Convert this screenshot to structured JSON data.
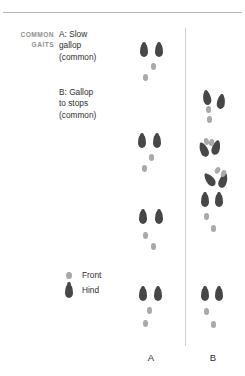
{
  "figure": {
    "section_label_line1": "COMMON",
    "section_label_line2": "GAITS",
    "captions": [
      {
        "id": "caption-a",
        "lines": [
          "A: Slow",
          "gallop",
          "(common)"
        ]
      },
      {
        "id": "caption-b",
        "lines": [
          "B: Gallop",
          "to stops",
          "(common)"
        ]
      }
    ],
    "legend": {
      "front_label": "Front",
      "hind_label": "Hind"
    },
    "columns": [
      {
        "id": "column-a",
        "label": "A"
      },
      {
        "id": "column-b",
        "label": "B"
      }
    ],
    "colors": {
      "hind_print": "#474747",
      "front_print": "#a9a9a9",
      "text": "#2e2e2e",
      "section_label": "#8f8f8f",
      "rule": "#b9b9b9",
      "divider": "#cfcfcf",
      "background": "#ffffff"
    }
  },
  "chart_data": {
    "type": "scatter",
    "xlabel": "",
    "ylabel": "",
    "legend": [
      {
        "name": "Front",
        "color": "#a9a9a9",
        "shape": "small oval"
      },
      {
        "name": "Hind",
        "color": "#474747",
        "shape": "teardrop"
      }
    ],
    "legend_position": "lower-left",
    "grid": false,
    "axis_tick_labels": [
      "A",
      "B"
    ],
    "series": [
      {
        "name": "A: Slow gallop (common)",
        "column": "A",
        "groups": [
          {
            "group": 1,
            "prints": [
              {
                "type": "hind",
                "x": 140,
                "y": 43,
                "rot": 0
              },
              {
                "type": "hind",
                "x": 155,
                "y": 43,
                "rot": 0
              },
              {
                "type": "front",
                "x": 151,
                "y": 63,
                "rot": 0
              },
              {
                "type": "front",
                "x": 143,
                "y": 74,
                "rot": 0
              }
            ]
          },
          {
            "group": 2,
            "prints": [
              {
                "type": "hind",
                "x": 138,
                "y": 134,
                "rot": 0
              },
              {
                "type": "hind",
                "x": 153,
                "y": 134,
                "rot": 0
              },
              {
                "type": "front",
                "x": 149,
                "y": 154,
                "rot": 0
              },
              {
                "type": "front",
                "x": 142,
                "y": 165,
                "rot": 0
              }
            ]
          },
          {
            "group": 3,
            "prints": [
              {
                "type": "hind",
                "x": 139,
                "y": 210,
                "rot": 0
              },
              {
                "type": "hind",
                "x": 155,
                "y": 210,
                "rot": 0
              },
              {
                "type": "front",
                "x": 143,
                "y": 232,
                "rot": 0
              },
              {
                "type": "front",
                "x": 151,
                "y": 243,
                "rot": 0
              }
            ]
          },
          {
            "group": 4,
            "prints": [
              {
                "type": "hind",
                "x": 139,
                "y": 287,
                "rot": 0
              },
              {
                "type": "hind",
                "x": 154,
                "y": 287,
                "rot": 0
              },
              {
                "type": "front",
                "x": 147,
                "y": 307,
                "rot": 0
              },
              {
                "type": "front",
                "x": 143,
                "y": 320,
                "rot": 0
              }
            ]
          }
        ]
      },
      {
        "name": "B: Gallop to stops (common)",
        "column": "B",
        "groups": [
          {
            "group": 1,
            "prints": [
              {
                "type": "hind",
                "x": 203,
                "y": 91,
                "rot": -10
              },
              {
                "type": "hind",
                "x": 217,
                "y": 95,
                "rot": 8
              },
              {
                "type": "front",
                "x": 206,
                "y": 106,
                "rot": 0
              },
              {
                "type": "front",
                "x": 207,
                "y": 116,
                "rot": 0
              }
            ]
          },
          {
            "group": 2,
            "prints": [
              {
                "type": "hind",
                "x": 200,
                "y": 143,
                "rot": -24
              },
              {
                "type": "hind",
                "x": 212,
                "y": 141,
                "rot": 16
              },
              {
                "type": "front",
                "x": 204,
                "y": 138,
                "rot": -20
              },
              {
                "type": "front",
                "x": 209,
                "y": 139,
                "rot": 12
              }
            ]
          },
          {
            "group": 3,
            "prints": [
              {
                "type": "hind",
                "x": 206,
                "y": 173,
                "rot": -38
              },
              {
                "type": "hind",
                "x": 219,
                "y": 174,
                "rot": 20
              },
              {
                "type": "front",
                "x": 215,
                "y": 167,
                "rot": 30
              },
              {
                "type": "front",
                "x": 221,
                "y": 170,
                "rot": 22
              }
            ]
          },
          {
            "group": 4,
            "prints": [
              {
                "type": "hind",
                "x": 201,
                "y": 193,
                "rot": 0
              },
              {
                "type": "hind",
                "x": 215,
                "y": 193,
                "rot": 0
              },
              {
                "type": "front",
                "x": 204,
                "y": 213,
                "rot": 0
              },
              {
                "type": "front",
                "x": 211,
                "y": 225,
                "rot": 0
              }
            ]
          },
          {
            "group": 5,
            "prints": [
              {
                "type": "hind",
                "x": 201,
                "y": 287,
                "rot": 0
              },
              {
                "type": "hind",
                "x": 215,
                "y": 287,
                "rot": 0
              },
              {
                "type": "front",
                "x": 204,
                "y": 308,
                "rot": 0
              },
              {
                "type": "front",
                "x": 211,
                "y": 321,
                "rot": 0
              }
            ]
          }
        ]
      }
    ]
  }
}
